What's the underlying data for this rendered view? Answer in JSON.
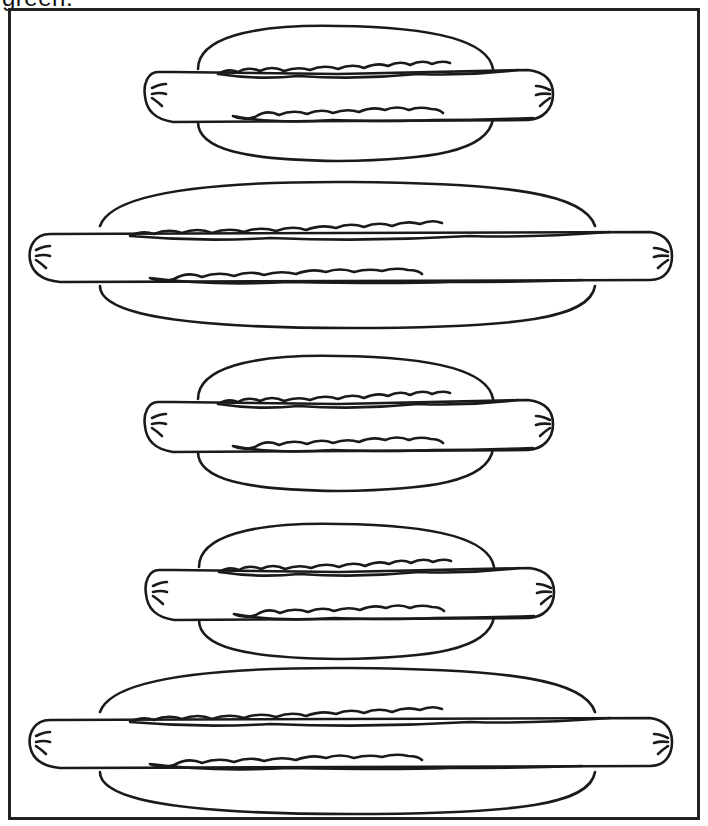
{
  "worksheet": {
    "caption_fragment": "green.",
    "frame": {
      "border_color": "#222222"
    },
    "hotdogs": [
      {
        "id": 1,
        "size": "small"
      },
      {
        "id": 2,
        "size": "large"
      },
      {
        "id": 3,
        "size": "small"
      },
      {
        "id": 4,
        "size": "small"
      },
      {
        "id": 5,
        "size": "large"
      }
    ],
    "stroke_color": "#1a1a1a"
  }
}
